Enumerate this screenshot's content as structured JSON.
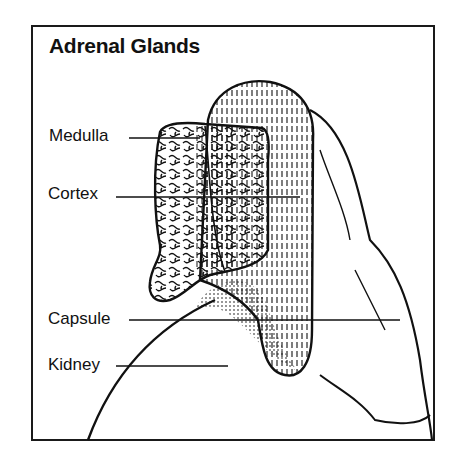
{
  "title": "Adrenal Glands",
  "labels": {
    "medulla": "Medulla",
    "cortex": "Cortex",
    "capsule": "Capsule",
    "kidney": "Kidney"
  },
  "colors": {
    "ink": "#111111",
    "background": "#ffffff"
  }
}
